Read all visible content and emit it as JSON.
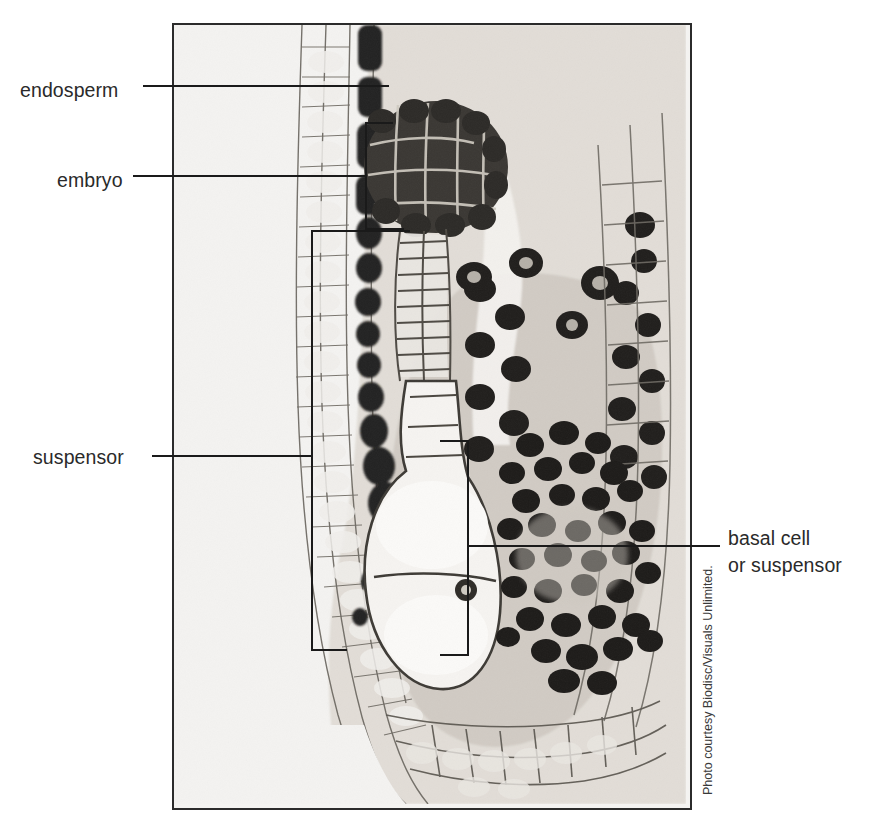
{
  "figure": {
    "type": "labeled-micrograph",
    "plate": {
      "border_color": "#2b2b2b",
      "background_color": "#f4f3f1",
      "stain_dark_color": "#262626",
      "stain_mid_color": "#7b7770",
      "stain_light_color": "#cfccc6"
    },
    "labels": [
      {
        "id": "endosperm",
        "text": "endosperm",
        "side": "left"
      },
      {
        "id": "embryo",
        "text": "embryo",
        "side": "left"
      },
      {
        "id": "suspensor",
        "text": "suspensor",
        "side": "left"
      },
      {
        "id": "basal-cell",
        "text_line_1": "basal cell",
        "text_line_2": "or suspensor",
        "side": "right"
      }
    ],
    "credit": "Photo courtesy Biodisc/Visuals Unlimited.",
    "cut_caption": ""
  }
}
